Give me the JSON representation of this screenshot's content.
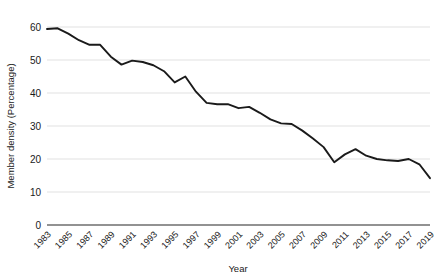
{
  "chart_data": {
    "type": "line",
    "title": "",
    "xlabel": "Year",
    "ylabel": "Member density (Percentage)",
    "xlim": [
      1983,
      2019
    ],
    "ylim": [
      0,
      60
    ],
    "yticks": [
      0,
      10,
      20,
      30,
      40,
      50,
      60
    ],
    "ytick_labels": [
      "0",
      "10",
      "20",
      "30",
      "40",
      "50",
      "60"
    ],
    "xtick_labels": [
      "1983",
      "1985",
      "1987",
      "1989",
      "1991",
      "1993",
      "1995",
      "1997",
      "1999",
      "2001",
      "2003",
      "2005",
      "2007",
      "2009",
      "2011",
      "2013",
      "2015",
      "2017",
      "2019"
    ],
    "grid": "horizontal",
    "legend": "none",
    "line_color": "#1a1a1a",
    "series": [
      {
        "name": "Member density",
        "x": [
          1983,
          1984,
          1985,
          1986,
          1987,
          1988,
          1989,
          1990,
          1991,
          1992,
          1993,
          1994,
          1995,
          1996,
          1997,
          1998,
          1999,
          2000,
          2001,
          2002,
          2003,
          2004,
          2005,
          2006,
          2007,
          2008,
          2009,
          2010,
          2011,
          2012,
          2013,
          2014,
          2015,
          2016,
          2017,
          2018,
          2019
        ],
        "values": [
          59.4,
          59.6,
          58.0,
          56.0,
          54.6,
          54.6,
          51.0,
          48.6,
          49.8,
          49.4,
          48.4,
          46.6,
          43.2,
          45.0,
          40.4,
          37.0,
          36.6,
          36.6,
          35.4,
          35.8,
          34.0,
          32.0,
          30.8,
          30.6,
          28.6,
          26.2,
          23.6,
          19.0,
          21.4,
          23.0,
          21.0,
          20.0,
          19.6,
          19.4,
          20.0,
          18.4,
          14.2
        ]
      }
    ]
  },
  "axes": {
    "x_title": "Year",
    "y_title": "Member density (Percentage)"
  }
}
